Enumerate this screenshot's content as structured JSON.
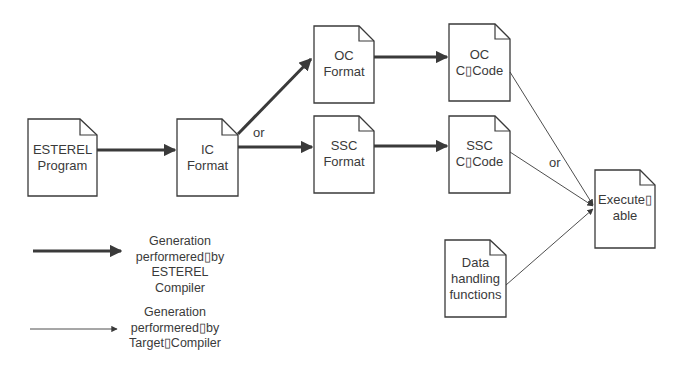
{
  "diagram": {
    "colors": {
      "stroke": "#3a3a3a",
      "background": "#ffffff"
    },
    "nodes": [
      {
        "id": "esterel-program",
        "lines": [
          "ESTEREL",
          "Program"
        ],
        "x": 28,
        "y": 119,
        "w": 69,
        "h": 77
      },
      {
        "id": "ic-format",
        "lines": [
          "IC",
          "Format"
        ],
        "x": 177,
        "y": 119,
        "w": 61,
        "h": 77
      },
      {
        "id": "oc-format",
        "lines": [
          "OC",
          "Format"
        ],
        "x": 314,
        "y": 26,
        "w": 60,
        "h": 77
      },
      {
        "id": "ssc-format",
        "lines": [
          "SSC",
          "Format"
        ],
        "x": 314,
        "y": 116,
        "w": 60,
        "h": 77
      },
      {
        "id": "oc-c-code",
        "lines": [
          "OC",
          "C▯Code"
        ],
        "x": 449,
        "y": 24,
        "w": 61,
        "h": 77
      },
      {
        "id": "ssc-c-code",
        "lines": [
          "SSC",
          "C▯Code"
        ],
        "x": 449,
        "y": 116,
        "w": 61,
        "h": 77
      },
      {
        "id": "executable",
        "lines": [
          "Execute▯",
          "able"
        ],
        "x": 595,
        "y": 170,
        "w": 60,
        "h": 78
      },
      {
        "id": "data-handling-functions",
        "lines": [
          "Data",
          "handling",
          "functions"
        ],
        "x": 445,
        "y": 240,
        "w": 61,
        "h": 77
      }
    ],
    "edges": [
      {
        "from": "esterel-program",
        "to": "ic-format",
        "kind": "esterel-compiler"
      },
      {
        "from": "ic-format",
        "to": "oc-format",
        "kind": "esterel-compiler"
      },
      {
        "from": "ic-format",
        "to": "ssc-format",
        "kind": "esterel-compiler"
      },
      {
        "from": "oc-format",
        "to": "oc-c-code",
        "kind": "esterel-compiler"
      },
      {
        "from": "ssc-format",
        "to": "ssc-c-code",
        "kind": "esterel-compiler"
      },
      {
        "from": "oc-c-code",
        "to": "executable",
        "kind": "target-compiler"
      },
      {
        "from": "ssc-c-code",
        "to": "executable",
        "kind": "target-compiler"
      },
      {
        "from": "data-handling-functions",
        "to": "executable",
        "kind": "target-compiler"
      }
    ],
    "annotations": {
      "or_ic": "or",
      "or_exec": "or"
    },
    "legend": {
      "thick": {
        "lines": [
          "Generation",
          "performered▯by",
          "ESTEREL",
          "Compiler"
        ]
      },
      "thin": {
        "lines": [
          "Generation",
          "performered▯by",
          "Target▯Compiler"
        ]
      }
    }
  }
}
